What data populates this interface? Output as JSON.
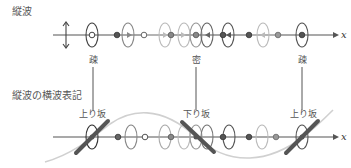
{
  "title_top": "縦波",
  "title_bottom": "縦波の横波表記",
  "axis_label": "x",
  "top_labels": [
    {
      "text": "疎",
      "x": 93
    },
    {
      "text": "密",
      "x": 196
    },
    {
      "text": "疎",
      "x": 302
    }
  ],
  "bottom_labels": [
    {
      "text": "上り坂",
      "x": 92
    },
    {
      "text": "下り坂",
      "x": 196
    },
    {
      "text": "上り坂",
      "x": 303
    }
  ],
  "colors": {
    "dark": "#444444",
    "mid": "#888888",
    "light": "#b8b8b8",
    "curve": "#d0d0d0",
    "slope": "#555555"
  }
}
